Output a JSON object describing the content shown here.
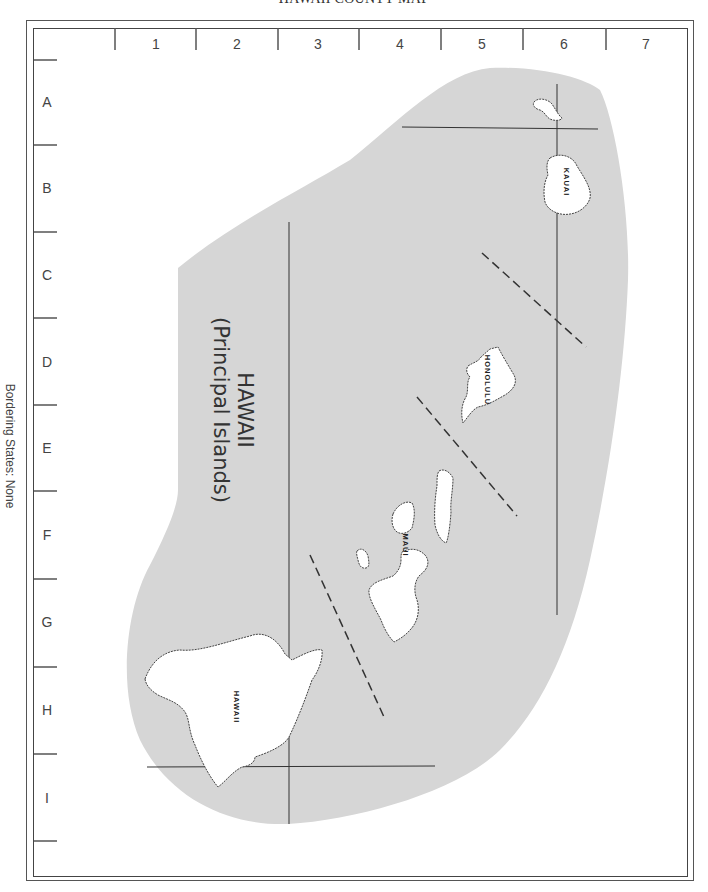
{
  "title": "HAWAII COUNTY MAP",
  "map_heading": {
    "line1": "HAWAII",
    "line2": "(Principal Islands)"
  },
  "side_note": "Bordering States: None",
  "grid": {
    "columns": [
      "1",
      "2",
      "3",
      "4",
      "5",
      "6",
      "7"
    ],
    "rows": [
      "A",
      "B",
      "C",
      "D",
      "E",
      "F",
      "G",
      "H",
      "I"
    ]
  },
  "islands": {
    "kauai": "KAUAI",
    "honolulu": "HONOLULU",
    "maui": "MAUI",
    "hawaii": "HAWAII"
  },
  "colors": {
    "land_area": "#d6d6d6",
    "island_fill": "#ffffff",
    "line": "#333333"
  }
}
